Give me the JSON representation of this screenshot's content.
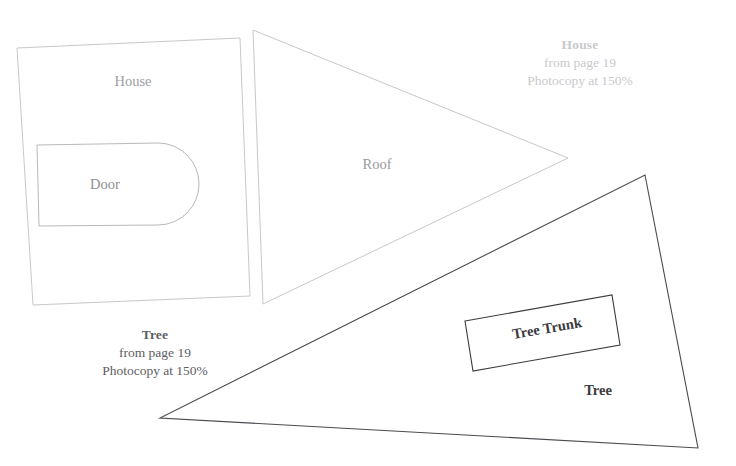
{
  "page": {
    "background": "#ffffff",
    "width": 736,
    "height": 466,
    "kind": "pattern-template-sheet"
  },
  "captions": {
    "house": {
      "title": "House",
      "source": "from page 19",
      "instruction": "Photocopy at 150%",
      "color": "#c9c9cd"
    },
    "tree": {
      "title": "Tree",
      "source": "from page 19",
      "instruction": "Photocopy at 150%",
      "color": "#5d5d63"
    }
  },
  "shapes": {
    "house_body": {
      "label": "House",
      "stroke": "#c8c8cc",
      "fill": "#ffffff",
      "points": "17,48 240,38 250,296 33,305"
    },
    "door": {
      "label": "Door",
      "stroke": "#b9b9be",
      "fill": "#ffffff",
      "path": "M 37,145 L 158,143 A 41,41 0 0 1 158,225 L 39,226 Z"
    },
    "roof": {
      "label": "Roof",
      "stroke": "#c8c8cc",
      "fill": "#ffffff",
      "points": "253,30 568,158 263,304"
    },
    "tree": {
      "label": "Tree",
      "stroke": "#4a4a50",
      "fill": "#ffffff",
      "points": "645,175 698,448 160,418"
    },
    "tree_trunk": {
      "label": "Tree Trunk",
      "stroke": "#3a3a40",
      "fill": "#ffffff",
      "points": "465,321 612,295 620,345 473,371"
    }
  }
}
